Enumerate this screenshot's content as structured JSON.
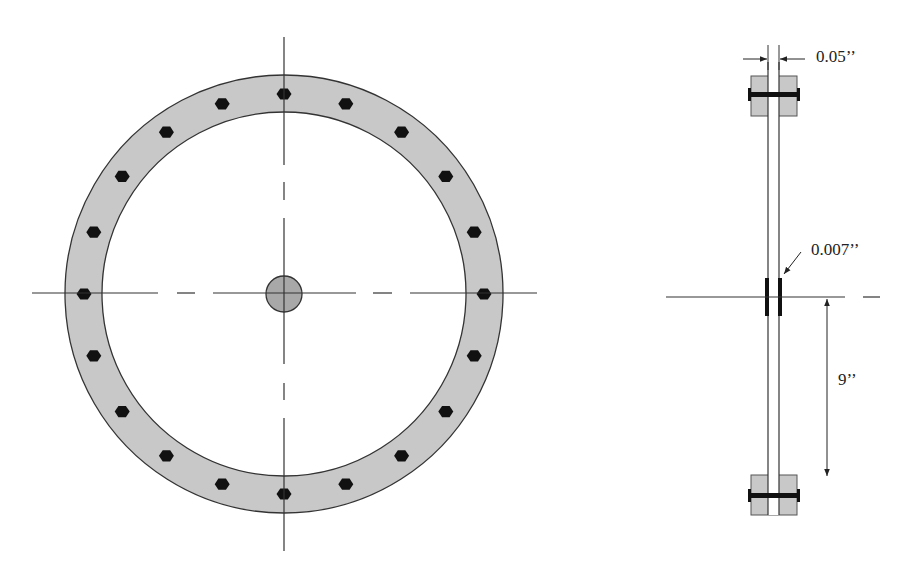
{
  "diagram": {
    "front_view": {
      "center": [
        284,
        294
      ],
      "ring_outer_radius": 219,
      "ring_inner_radius": 182,
      "bolt_circle_radius": 200,
      "bolt_count": 20,
      "hub_radius": 18
    },
    "side_view": {
      "labels": {
        "plate_gap": "0.05’’",
        "gauge_thickness": "0.007’’",
        "radius": "9’’"
      }
    },
    "colors": {
      "ring_fill": "#c8c8c8",
      "hub_fill": "#a8a8a8",
      "line": "#333333",
      "bolt": "#111111"
    }
  }
}
